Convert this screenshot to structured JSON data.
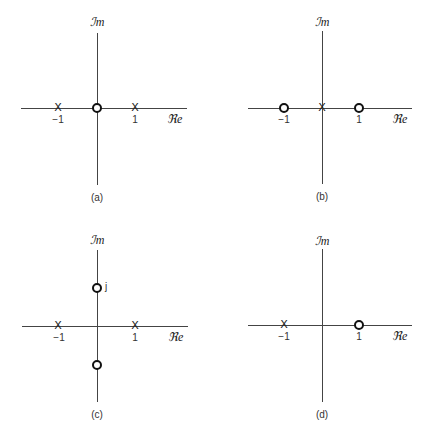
{
  "figure": {
    "panels": [
      {
        "id": "a",
        "caption": "(a)",
        "axis_labels": {
          "real": "ℜe",
          "imag": "ℐm"
        },
        "ticks": [
          {
            "value": -1,
            "label": "−1"
          },
          {
            "value": 1,
            "label": "1"
          }
        ],
        "poles": [
          {
            "re": -1,
            "im": 0,
            "symbol": "X"
          },
          {
            "re": 1,
            "im": 0,
            "symbol": "X"
          }
        ],
        "zeros": [
          {
            "re": 0,
            "im": 0
          }
        ]
      },
      {
        "id": "b",
        "caption": "(b)",
        "axis_labels": {
          "real": "ℜe",
          "imag": "ℐm"
        },
        "ticks": [
          {
            "value": -1,
            "label": "−1"
          },
          {
            "value": 1,
            "label": "1"
          }
        ],
        "poles": [
          {
            "re": 0,
            "im": 0,
            "symbol": "X"
          }
        ],
        "zeros": [
          {
            "re": -1,
            "im": 0
          },
          {
            "re": 1,
            "im": 0
          }
        ]
      },
      {
        "id": "c",
        "caption": "(c)",
        "axis_labels": {
          "real": "ℜe",
          "imag": "ℐm"
        },
        "ticks": [
          {
            "value": -1,
            "label": "−1"
          },
          {
            "value": 1,
            "label": "1"
          }
        ],
        "poles": [
          {
            "re": -1,
            "im": 0,
            "symbol": "X"
          },
          {
            "re": 1,
            "im": 0,
            "symbol": "X"
          }
        ],
        "zeros": [
          {
            "re": 0,
            "im": 1,
            "label": "j"
          },
          {
            "re": 0,
            "im": -1
          }
        ]
      },
      {
        "id": "d",
        "caption": "(d)",
        "axis_labels": {
          "real": "ℜe",
          "imag": "ℐm"
        },
        "ticks": [
          {
            "value": -1,
            "label": "−1"
          },
          {
            "value": 1,
            "label": "1"
          }
        ],
        "poles": [
          {
            "re": -1,
            "im": 0,
            "symbol": "X"
          }
        ],
        "zeros": [
          {
            "re": 1,
            "im": 0
          }
        ]
      }
    ]
  }
}
